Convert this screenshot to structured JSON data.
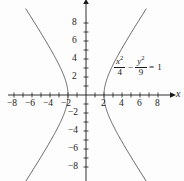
{
  "chart_data": {
    "type": "line",
    "title": "",
    "subtitle": "",
    "xlabel": "x",
    "ylabel": "",
    "xlim": [
      -9,
      9.5
    ],
    "ylim": [
      -9.5,
      9.5
    ],
    "grid": false,
    "legend": "none",
    "equation": {
      "lhs_num_1": "x",
      "lhs_num_1_exp": "2",
      "lhs_den_1": "4",
      "operator": "−",
      "lhs_num_2": "y",
      "lhs_num_2_exp": "2",
      "lhs_den_2": "9",
      "equals": "=",
      "rhs": "1",
      "plain": "x^2/4 - y^2/9 = 1"
    },
    "curve_type": "hyperbola",
    "a": 2,
    "b": 3,
    "vertices": [
      [
        -2,
        0
      ],
      [
        2,
        0
      ]
    ],
    "x_ticks": [
      -8,
      -7,
      -6,
      -5,
      -4,
      -3,
      -2,
      -1,
      1,
      2,
      3,
      4,
      5,
      6,
      7,
      8
    ],
    "x_tick_labels": [
      "−8",
      "−6",
      "−4",
      "−2",
      "2",
      "4",
      "6",
      "8"
    ],
    "x_labeled_values": [
      -8,
      -6,
      -4,
      -2,
      2,
      4,
      6,
      8
    ],
    "y_ticks": [
      -8,
      -7,
      -6,
      -5,
      -4,
      -3,
      -2,
      -1,
      1,
      2,
      3,
      4,
      5,
      6,
      7,
      8
    ],
    "y_tick_labels": [
      "8",
      "6",
      "4",
      "2",
      "−2",
      "−4",
      "−6",
      "−8"
    ],
    "y_labeled_values": [
      8,
      6,
      4,
      2,
      -2,
      -4,
      -6,
      -8
    ],
    "series": [
      {
        "name": "left-branch",
        "comment": "x = -2*cosh(t), y = 3*sinh(t), |y| <= 9.4",
        "x_range": [
          -6.0,
          -2.0
        ],
        "y_range": [
          -9.4,
          9.4
        ]
      },
      {
        "name": "right-branch",
        "comment": "x = 2*cosh(t), y = 3*sinh(t), |y| <= 9.4",
        "x_range": [
          2.0,
          6.0
        ],
        "y_range": [
          -9.4,
          9.4
        ]
      }
    ]
  },
  "colors": {
    "background": "#fdfdfd",
    "axis": "#1a1a1a",
    "curve": "#4a4a4a",
    "text": "#1a1a1a"
  },
  "axis_labels": {
    "x_axis_name": "x"
  }
}
